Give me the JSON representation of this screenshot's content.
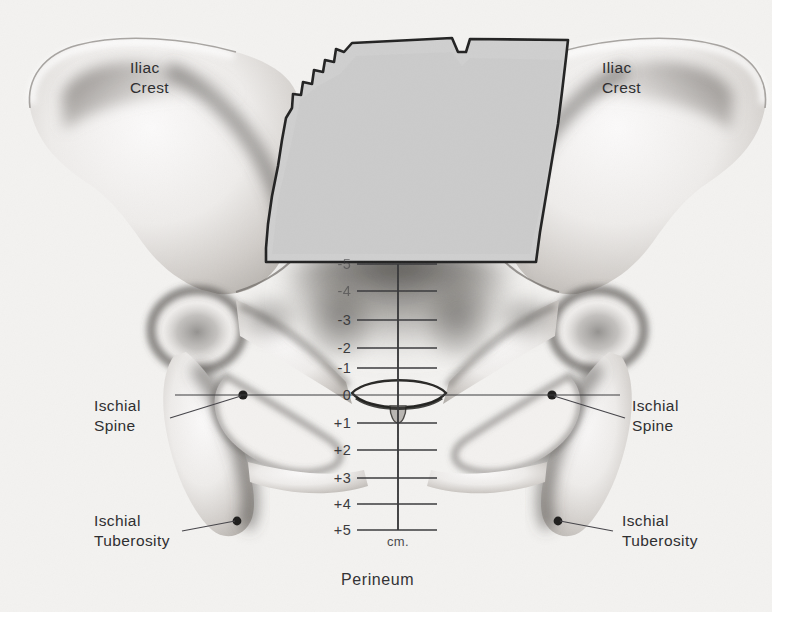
{
  "figure": {
    "view": "anterior",
    "background_color": "#f3f2f0",
    "ink_color": "#2f2f31"
  },
  "labels": {
    "iliac_crest_left": {
      "line1": "Iliac",
      "line2": "Crest"
    },
    "iliac_crest_right": {
      "line1": "Iliac",
      "line2": "Crest"
    },
    "ischial_spine_left": {
      "line1": "Ischial",
      "line2": "Spine"
    },
    "ischial_spine_right": {
      "line1": "Ischial",
      "line2": "Spine"
    },
    "ischial_tuberosity_left": {
      "line1": "Ischial",
      "line2": "Tuberosity"
    },
    "ischial_tuberosity_right": {
      "line1": "Ischial",
      "line2": "Tuberosity"
    }
  },
  "scale": {
    "unit_label": "cm.",
    "bottom_label": "Perineum",
    "zero_station_label": "0",
    "ticks": [
      {
        "label": "-5",
        "value": -5,
        "y": 264,
        "wide": false
      },
      {
        "label": "-4",
        "value": -4,
        "y": 291,
        "wide": false
      },
      {
        "label": "-3",
        "value": -3,
        "y": 320,
        "wide": false
      },
      {
        "label": "-2",
        "value": -2,
        "y": 348,
        "wide": false
      },
      {
        "label": "-1",
        "value": -1,
        "y": 368,
        "wide": false
      },
      {
        "label": "0",
        "value": 0,
        "y": 395,
        "wide": true
      },
      {
        "label": "+1",
        "value": 1,
        "y": 423,
        "wide": false
      },
      {
        "label": "+2",
        "value": 2,
        "y": 450,
        "wide": false
      },
      {
        "label": "+3",
        "value": 3,
        "y": 478,
        "wide": false
      },
      {
        "label": "+4",
        "value": 4,
        "y": 504,
        "wide": false
      },
      {
        "label": "+5",
        "value": 5,
        "y": 530,
        "wide": false
      }
    ]
  }
}
